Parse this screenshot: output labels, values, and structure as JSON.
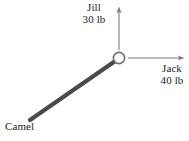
{
  "figure": {
    "background_color": "#ffffff",
    "ink_color": "#4a4a4a",
    "text_color": "#1a1a1a"
  },
  "ring": {
    "name": "ring",
    "cx": 119,
    "cy": 58,
    "outer_radius": 6.5,
    "stroke_color": "#6e6e6e"
  },
  "vectors": [
    {
      "id": "jill",
      "label": "Jill",
      "magnitude": "30 lb",
      "direction": "up",
      "style": "thin-arrow",
      "color": "#6e6e6e",
      "from": [
        119,
        50
      ],
      "to": [
        119,
        7
      ]
    },
    {
      "id": "jack",
      "label": "Jack",
      "magnitude": "40 lb",
      "direction": "right",
      "style": "thin-arrow",
      "color": "#6e6e6e",
      "from": [
        128,
        58
      ],
      "to": [
        184,
        58
      ]
    },
    {
      "id": "camel",
      "label": "Camel",
      "magnitude": "",
      "direction": "down-left",
      "style": "thick-rope",
      "color": "#4a4a4a",
      "from": [
        114,
        62
      ],
      "to": [
        30,
        120
      ]
    }
  ],
  "labels": {
    "jill": {
      "name": "Jill",
      "force": "30 lb"
    },
    "jack": {
      "name": "Jack",
      "force": "40 lb"
    },
    "camel": {
      "name": "Camel"
    }
  }
}
